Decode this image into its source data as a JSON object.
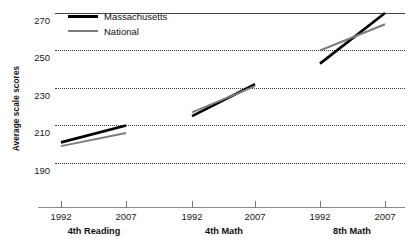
{
  "chart_data": {
    "type": "line",
    "title": "",
    "subtitle": "",
    "xlabel": "",
    "ylabel": "Average scale scores",
    "ylim": [
      190,
      270
    ],
    "yticks": [
      190,
      210,
      230,
      250,
      270
    ],
    "ytick_labels": [
      "190",
      "210",
      "230",
      "250",
      "270"
    ],
    "grid": true,
    "legend_position": "top-left",
    "legend": [
      "Massachusetts",
      "National"
    ],
    "colors": {
      "Massachusetts": "#000000",
      "National": "#7d7d7d",
      "gridline": "#3a3a3a",
      "axis": "#8a8a8a",
      "background": "#ffffff"
    },
    "panels": [
      {
        "label": "4th Reading",
        "x": [
          "1992",
          "2007"
        ],
        "series": [
          {
            "name": "Massachusetts",
            "values": [
              201,
              210
            ]
          },
          {
            "name": "National",
            "values": [
              199,
              206
            ]
          }
        ]
      },
      {
        "label": "4th Math",
        "x": [
          "1992",
          "2007"
        ],
        "series": [
          {
            "name": "Massachusetts",
            "values": [
              215,
              232
            ]
          },
          {
            "name": "National",
            "values": [
              217,
              231
            ]
          }
        ]
      },
      {
        "label": "8th Math",
        "x": [
          "1992",
          "2007"
        ],
        "series": [
          {
            "name": "Massachusetts",
            "values": [
              243,
              270
            ]
          },
          {
            "name": "National",
            "values": [
              250,
              264
            ]
          }
        ]
      }
    ]
  },
  "axis": {
    "y_title": "Average scale scores",
    "y_labels": [
      "270",
      "250",
      "230",
      "210",
      "190"
    ],
    "x_groups": [
      {
        "label": "4th Reading",
        "ticks": [
          "1992",
          "2007"
        ]
      },
      {
        "label": "4th Math",
        "ticks": [
          "1992",
          "2007"
        ]
      },
      {
        "label": "8th Math",
        "ticks": [
          "1992",
          "2007"
        ]
      }
    ]
  },
  "legend": {
    "items": [
      {
        "label": "Massachusetts",
        "color": "#000000"
      },
      {
        "label": "National",
        "color": "#7d7d7d"
      }
    ]
  }
}
